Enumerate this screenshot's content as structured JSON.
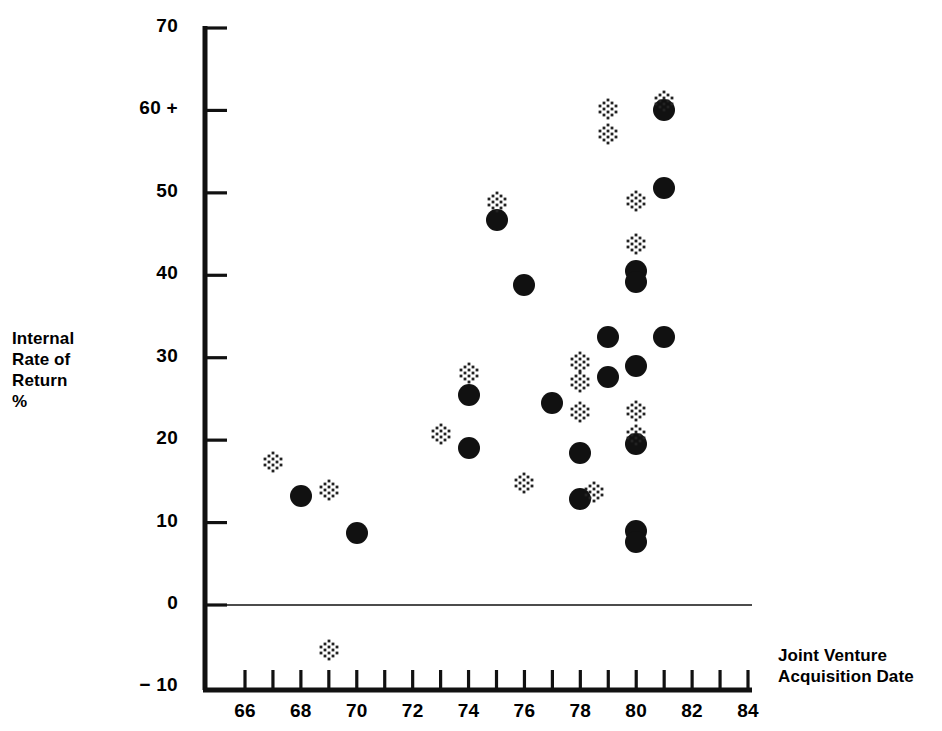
{
  "chart_data": {
    "type": "scatter",
    "title": "",
    "xlabel": "Joint Venture Acquisition Date",
    "ylabel": "Internal Rate of Return %",
    "xlim": [
      66,
      84
    ],
    "ylim": [
      -10,
      70
    ],
    "grid": false,
    "legend_position": "none",
    "x_ticks": [
      66,
      67,
      68,
      69,
      70,
      71,
      72,
      73,
      74,
      75,
      76,
      77,
      78,
      79,
      80,
      81,
      82,
      83,
      84
    ],
    "x_tick_labels": [
      "66",
      "68",
      "70",
      "72",
      "74",
      "76",
      "78",
      "80",
      "82",
      "84"
    ],
    "x_tick_label_values": [
      66,
      68,
      70,
      72,
      74,
      76,
      78,
      80,
      82,
      84
    ],
    "y_ticks": [
      -10,
      0,
      10,
      20,
      30,
      40,
      50,
      60,
      70
    ],
    "y_tick_labels": [
      "− 10",
      "0",
      "10",
      "20",
      "30",
      "40",
      "50",
      "60 +",
      "70"
    ],
    "zero_line": 0,
    "series": [
      {
        "name": "solid-circle",
        "marker": "filled-circle",
        "color": "#111111",
        "points": [
          {
            "x": 68.0,
            "y": 13.2
          },
          {
            "x": 70.0,
            "y": 8.7
          },
          {
            "x": 74.0,
            "y": 25.5
          },
          {
            "x": 74.0,
            "y": 19.0
          },
          {
            "x": 75.0,
            "y": 46.7
          },
          {
            "x": 76.0,
            "y": 38.8
          },
          {
            "x": 77.0,
            "y": 24.5
          },
          {
            "x": 78.0,
            "y": 18.5
          },
          {
            "x": 78.0,
            "y": 12.8
          },
          {
            "x": 79.0,
            "y": 32.5
          },
          {
            "x": 79.0,
            "y": 27.6
          },
          {
            "x": 80.0,
            "y": 40.5
          },
          {
            "x": 80.0,
            "y": 39.2
          },
          {
            "x": 80.0,
            "y": 29.0
          },
          {
            "x": 80.0,
            "y": 19.5
          },
          {
            "x": 80.0,
            "y": 9.0
          },
          {
            "x": 80.0,
            "y": 7.6
          },
          {
            "x": 81.0,
            "y": 50.6
          },
          {
            "x": 81.0,
            "y": 32.5
          },
          {
            "x": 81.0,
            "y": 60.0
          }
        ]
      },
      {
        "name": "stippled-diamond",
        "marker": "stippled-diamond",
        "color": "#222222",
        "points": [
          {
            "x": 67.0,
            "y": 17.4
          },
          {
            "x": 69.0,
            "y": 14.0
          },
          {
            "x": 69.0,
            "y": -5.5
          },
          {
            "x": 73.0,
            "y": 20.7
          },
          {
            "x": 74.0,
            "y": 28.2
          },
          {
            "x": 75.0,
            "y": 48.9
          },
          {
            "x": 76.0,
            "y": 14.8
          },
          {
            "x": 78.0,
            "y": 29.5
          },
          {
            "x": 78.0,
            "y": 27.0
          },
          {
            "x": 78.0,
            "y": 23.4
          },
          {
            "x": 78.5,
            "y": 13.7
          },
          {
            "x": 79.0,
            "y": 60.2
          },
          {
            "x": 79.0,
            "y": 57.2
          },
          {
            "x": 80.0,
            "y": 49.0
          },
          {
            "x": 80.0,
            "y": 43.8
          },
          {
            "x": 80.0,
            "y": 23.5
          },
          {
            "x": 80.0,
            "y": 20.6
          },
          {
            "x": 81.0,
            "y": 61.2
          }
        ]
      }
    ]
  },
  "axis": {
    "y_label_lines": [
      "Internal",
      "Rate of",
      "Return",
      "%"
    ],
    "x_title_lines": [
      "Joint Venture",
      "Acquisition Date"
    ]
  }
}
